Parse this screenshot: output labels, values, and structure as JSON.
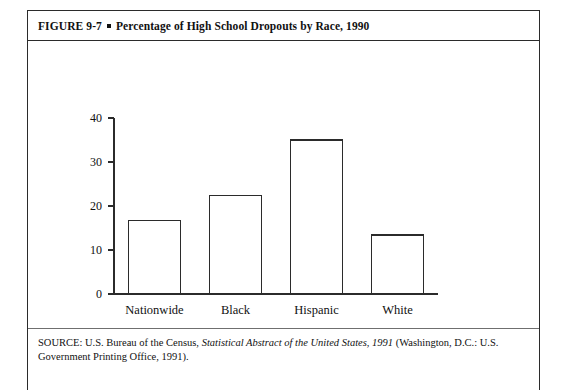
{
  "figure": {
    "label": "FIGURE 9-7",
    "separator_icon": "filled-square-bullet",
    "title": "Percentage of High School Dropouts by Race, 1990",
    "source_prefix": "SOURCE: U.S. Bureau of the Census,",
    "source_italic": "Statistical Abstract of the United States, 1991",
    "source_suffix": "(Washington, D.C.: U.S. Government Printing Office, 1991)."
  },
  "chart_data": {
    "type": "bar",
    "title": "Percentage of High School Dropouts by Race, 1990",
    "xlabel": "",
    "ylabel": "",
    "categories": [
      "Nationwide",
      "Black",
      "Hispanic",
      "White"
    ],
    "values": [
      16.8,
      22.4,
      35.0,
      13.4
    ],
    "ylim": [
      0,
      40
    ],
    "yticks": [
      0,
      10,
      20,
      30,
      40
    ],
    "ytick_labels": [
      "0",
      "10",
      "20",
      "30",
      "40"
    ],
    "grid": false,
    "legend": false,
    "bar_fill_color": "#ffffff",
    "bar_edge_color": "#2b2b2b",
    "axis_color": "#2b2b2b"
  }
}
